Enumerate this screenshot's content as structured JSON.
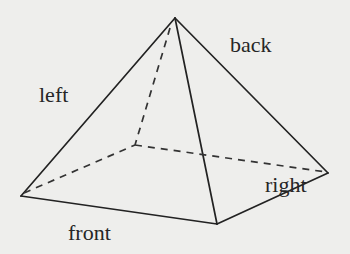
{
  "diagram": {
    "colors": {
      "background": "#eeeeec",
      "line": "#222222",
      "text": "#262626"
    },
    "vertices": {
      "apex": [
        175,
        18
      ],
      "front_left": [
        21,
        196
      ],
      "front_right": [
        217,
        224
      ],
      "back_right": [
        328,
        173
      ],
      "back_left": [
        135,
        145
      ]
    },
    "labels": {
      "left": "left",
      "back": "back",
      "right": "right",
      "front": "front"
    }
  }
}
